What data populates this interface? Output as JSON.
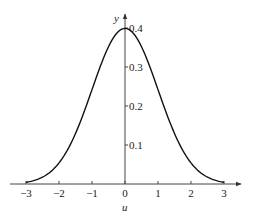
{
  "chart_data": {
    "type": "line",
    "title": "",
    "xlabel": "u",
    "ylabel": "y",
    "xlim": [
      -3,
      3
    ],
    "ylim": [
      0,
      0.4
    ],
    "grid": false,
    "legend": null,
    "x_ticks": [
      "-3",
      "-2",
      "-1",
      "0",
      "1",
      "2",
      "3"
    ],
    "y_ticks": [
      "0.1",
      "0.2",
      "0.3",
      "0.4"
    ],
    "series": [
      {
        "name": "standard normal density",
        "x": [
          -3,
          -2.5,
          -2,
          -1.5,
          -1,
          -0.5,
          0,
          0.5,
          1,
          1.5,
          2,
          2.5,
          3
        ],
        "values": [
          0.004,
          0.018,
          0.054,
          0.13,
          0.242,
          0.352,
          0.399,
          0.352,
          0.242,
          0.13,
          0.054,
          0.018,
          0.004
        ]
      }
    ]
  }
}
